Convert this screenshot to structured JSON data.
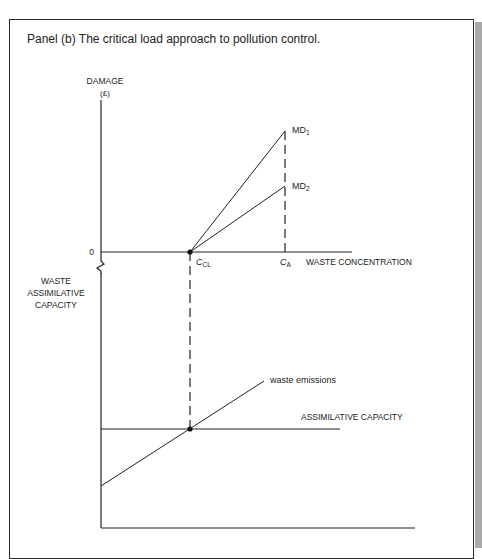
{
  "title": "Panel (b)  The critical load approach to pollution control.",
  "upper_panel": {
    "y_axis_label_line1": "DAMAGE",
    "y_axis_label_line2": "(£)",
    "origin_label": "0",
    "x_axis_label": "WASTE CONCENTRATION",
    "x_marks": [
      {
        "id": "ccl",
        "main": "C",
        "sub": "CL"
      },
      {
        "id": "ca",
        "main": "C",
        "sub": "A"
      }
    ],
    "curves": [
      {
        "id": "md1",
        "main": "MD",
        "sub": "1"
      },
      {
        "id": "md2",
        "main": "MD",
        "sub": "2"
      }
    ]
  },
  "lower_panel": {
    "y_axis_label_lines": [
      "WASTE",
      "ASSIMILATIVE",
      "CAPACITY"
    ],
    "lines": [
      {
        "id": "waste-emissions",
        "label": "waste emissions"
      },
      {
        "id": "assimilative-capacity",
        "label": "ASSIMILATIVE CAPACITY"
      }
    ]
  },
  "colors": {
    "ink": "#222222",
    "frame": "#2a2a2a",
    "shade": "#a9a9a9"
  }
}
